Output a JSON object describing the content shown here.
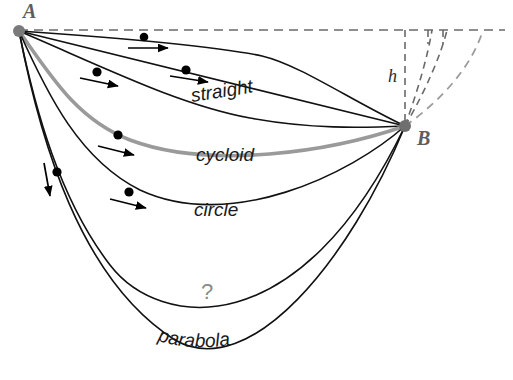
{
  "figure": {
    "title_alt": "Brachistochrone comparison of descent paths from A to B",
    "background": "#ffffff",
    "width": 513,
    "height": 380
  },
  "points": {
    "start": {
      "id": "A",
      "label": "A",
      "x": 19,
      "y": 31,
      "dot_color": "#7a7a7a",
      "dot_radius": 6,
      "label_x": 23,
      "label_y": 18
    },
    "end": {
      "id": "B",
      "label": "B",
      "x": 405,
      "y": 126,
      "dot_color": "#6f6f6f",
      "dot_radius": 6,
      "label_x": 417,
      "label_y": 145
    }
  },
  "curves": [
    {
      "name": "upper-arc",
      "label": "",
      "color": "#111111",
      "width": 1.6,
      "path": "M 19 31 C 120 38, 215 46, 262 56 C 300 65, 350 100, 405 126"
    },
    {
      "name": "straight",
      "label": "straight",
      "color": "#111111",
      "width": 1.6,
      "path": "M 19 31 L 405 126",
      "label_x": 192,
      "label_y": 102,
      "label_rotation": -9,
      "label_size": 19
    },
    {
      "name": "straight-lower-arc",
      "label": "",
      "color": "#111111",
      "width": 1.6,
      "path": "M 19 31 C 110 70, 180 105, 250 118 C 310 129, 360 128, 405 126"
    },
    {
      "name": "cycloid",
      "label": "cycloid",
      "color": "#9a9a9a",
      "width": 3.6,
      "path": "M 19 31 C 52 78, 78 120, 130 140 C 210 170, 330 152, 405 126",
      "label_x": 196,
      "label_y": 161,
      "label_rotation": 0,
      "label_size": 19
    },
    {
      "name": "circle",
      "label": "circle",
      "color": "#111111",
      "width": 1.6,
      "path": "M 19 31 C 48 96, 80 160, 140 190 C 230 232, 350 175, 405 126",
      "label_x": 194,
      "label_y": 216,
      "label_rotation": 0,
      "label_size": 19
    },
    {
      "name": "parabola",
      "label": "parabola",
      "color": "#111111",
      "width": 1.6,
      "path": "M 19 31 C 40 140, 80 280, 175 340 C 250 383, 350 260, 405 126",
      "label_size": 19,
      "label_path": "M 150 338 C 200 358, 280 345, 330 300"
    },
    {
      "name": "steep-inner",
      "label": "",
      "color": "#111111",
      "width": 1.6,
      "path": "M 19 31 C 35 110, 60 200, 110 265 C 160 330, 300 345, 405 126"
    }
  ],
  "dashed_elements": [
    {
      "name": "horizontal-datum",
      "color": "#6a6a6a",
      "width": 1.6,
      "dash": "9 6",
      "path": "M 19 30 L 505 30"
    },
    {
      "name": "height-drop-line",
      "color": "#6a6a6a",
      "width": 1.6,
      "dash": "7 5",
      "path": "M 405 30 L 405 126"
    },
    {
      "name": "dashed-curve-inner",
      "color": "#6a6a6a",
      "width": 1.6,
      "dash": "7 5",
      "path": "M 405 126 C 418 90, 428 55, 432 30"
    },
    {
      "name": "dashed-curve-middle",
      "color": "#6a6a6a",
      "width": 1.6,
      "dash": "7 5",
      "path": "M 405 126 C 425 92, 441 55, 447 30"
    },
    {
      "name": "dashed-curve-outer",
      "color": "#9b9b9b",
      "width": 1.8,
      "dash": "8 6",
      "path": "M 405 126 C 442 100, 472 66, 483 30"
    },
    {
      "name": "dashed-tick-inner",
      "color": "#6a6a6a",
      "width": 1.6,
      "dash": "7 5",
      "path": "M 428 30 L 428 44"
    },
    {
      "name": "dashed-tick-middle",
      "color": "#6a6a6a",
      "width": 1.6,
      "dash": "7 5",
      "path": "M 443 30 L 443 44"
    }
  ],
  "height_label": {
    "text": "h",
    "x": 388,
    "y": 82,
    "size": 18,
    "color": "#2b2b2b"
  },
  "question_mark": {
    "text": "?",
    "x": 207,
    "y": 299,
    "size": 22,
    "color": "#8a8a8a"
  },
  "beads": [
    {
      "name": "bead-upper-arc-1",
      "x": 144,
      "y": 37,
      "r": 4.3,
      "color": "#000000",
      "arrow": {
        "x1": 128,
        "y1": 48,
        "x2": 168,
        "y2": 48
      }
    },
    {
      "name": "bead-straight-upper-1",
      "x": 97,
      "y": 72,
      "r": 4.6,
      "color": "#000000",
      "arrow": {
        "x1": 80,
        "y1": 78,
        "x2": 118,
        "y2": 86
      }
    },
    {
      "name": "bead-straight-upper-2",
      "x": 186,
      "y": 70,
      "r": 4.6,
      "color": "#000000",
      "arrow": {
        "x1": 170,
        "y1": 76,
        "x2": 208,
        "y2": 82
      }
    },
    {
      "name": "bead-cycloid-1",
      "x": 118,
      "y": 135,
      "r": 4.6,
      "color": "#000000",
      "arrow": {
        "x1": 98,
        "y1": 146,
        "x2": 134,
        "y2": 155
      }
    },
    {
      "name": "bead-circle-1",
      "x": 129,
      "y": 192,
      "r": 4.6,
      "color": "#000000",
      "arrow": {
        "x1": 110,
        "y1": 199,
        "x2": 146,
        "y2": 208
      }
    },
    {
      "name": "bead-steep-1",
      "x": 57,
      "y": 172,
      "r": 4.6,
      "color": "#000000",
      "arrow": {
        "x1": 44,
        "y1": 163,
        "x2": 50,
        "y2": 196
      }
    }
  ]
}
